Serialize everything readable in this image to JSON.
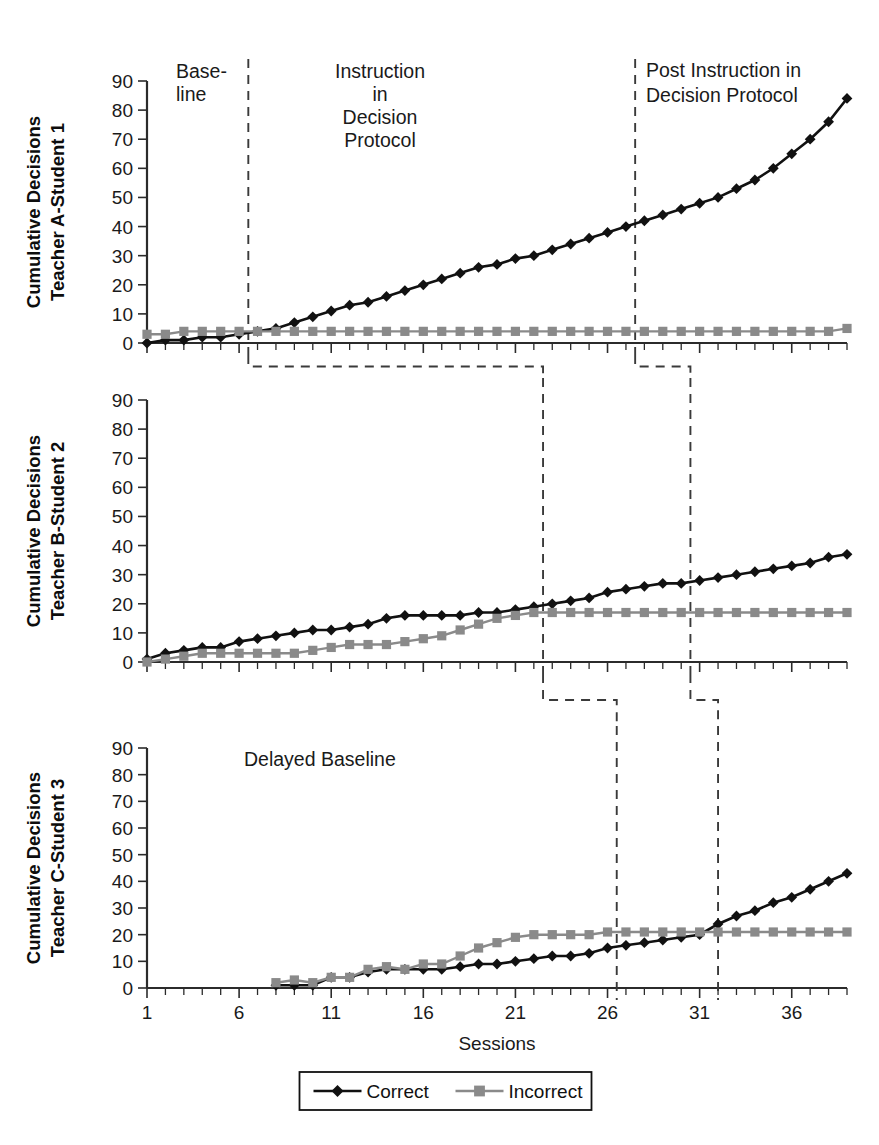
{
  "figure": {
    "x_axis_title": "Sessions",
    "y_tick_labels": [
      "0",
      "10",
      "20",
      "30",
      "40",
      "50",
      "60",
      "70",
      "80",
      "90"
    ],
    "x_tick_labels": [
      "1",
      "6",
      "11",
      "16",
      "21",
      "26",
      "31",
      "36"
    ],
    "legend": {
      "correct_label": "Correct",
      "incorrect_label": "Incorrect"
    },
    "colors": {
      "correct": "#111111",
      "incorrect": "#8a8a8a",
      "axis": "#2b2b2b",
      "phase_line": "#3a3a3a",
      "background": "#ffffff"
    },
    "panels": [
      {
        "id": "A",
        "y_axis_title_line1": "Cumulative Decisions",
        "y_axis_title_line2": "Teacher A-Student 1",
        "phase_labels": [
          {
            "name": "baseline",
            "text_line1": "Base-",
            "text_line2": "line"
          },
          {
            "name": "instruction",
            "text_line1": "Instruction",
            "text_line2": "in",
            "text_line3": "Decision",
            "text_line4": "Protocol"
          },
          {
            "name": "post-instruction",
            "text_line1": "Post Instruction in",
            "text_line2": "Decision Protocol"
          }
        ]
      },
      {
        "id": "B",
        "y_axis_title_line1": "Cumulative Decisions",
        "y_axis_title_line2": "Teacher B-Student 2",
        "phase_labels": []
      },
      {
        "id": "C",
        "y_axis_title_line1": "Cumulative Decisions",
        "y_axis_title_line2": "Teacher C-Student 3",
        "phase_labels": [
          {
            "name": "delayed-baseline",
            "text_line1": "Delayed Baseline"
          }
        ]
      }
    ]
  },
  "chart_data": {
    "type": "line",
    "title": "",
    "xlabel": "Sessions",
    "ylabel": "Cumulative Decisions",
    "xlim": [
      1,
      39
    ],
    "ylim": [
      0,
      90
    ],
    "xticks": [
      1,
      6,
      11,
      16,
      21,
      26,
      31,
      36
    ],
    "yticks": [
      0,
      10,
      20,
      30,
      40,
      50,
      60,
      70,
      80,
      90
    ],
    "grid": false,
    "legend": [
      "Correct",
      "Incorrect"
    ],
    "legend_position": "bottom-center",
    "panels": [
      {
        "name": "Teacher A-Student 1",
        "ylabel": "Cumulative Decisions Teacher A-Student 1",
        "phase_change_sessions": [
          6.5,
          27.5
        ],
        "phase_names": [
          "Baseline",
          "Instruction in Decision Protocol",
          "Post Instruction in Decision Protocol"
        ],
        "x": [
          1,
          2,
          3,
          4,
          5,
          6,
          7,
          8,
          9,
          10,
          11,
          12,
          13,
          14,
          15,
          16,
          17,
          18,
          19,
          20,
          21,
          22,
          23,
          24,
          25,
          26,
          27,
          28,
          29,
          30,
          31,
          32,
          33,
          34,
          35,
          36,
          37,
          38,
          39
        ],
        "series": [
          {
            "name": "Correct",
            "color": "#111111",
            "marker": "diamond",
            "values": [
              0,
              1,
              1,
              2,
              2,
              3,
              4,
              5,
              7,
              9,
              11,
              13,
              14,
              16,
              18,
              20,
              22,
              24,
              26,
              27,
              29,
              30,
              32,
              34,
              36,
              38,
              40,
              42,
              44,
              46,
              48,
              50,
              53,
              56,
              60,
              65,
              70,
              76,
              84
            ]
          },
          {
            "name": "Incorrect",
            "color": "#8a8a8a",
            "marker": "square",
            "values": [
              3,
              3,
              4,
              4,
              4,
              4,
              4,
              4,
              4,
              4,
              4,
              4,
              4,
              4,
              4,
              4,
              4,
              4,
              4,
              4,
              4,
              4,
              4,
              4,
              4,
              4,
              4,
              4,
              4,
              4,
              4,
              4,
              4,
              4,
              4,
              4,
              4,
              4,
              5
            ]
          }
        ]
      },
      {
        "name": "Teacher B-Student 2",
        "ylabel": "Cumulative Decisions Teacher B-Student 2",
        "phase_change_sessions": [
          22.5,
          30.5
        ],
        "phase_names": [
          "Baseline",
          "Instruction in Decision Protocol",
          "Post Instruction in Decision Protocol"
        ],
        "x": [
          1,
          2,
          3,
          4,
          5,
          6,
          7,
          8,
          9,
          10,
          11,
          12,
          13,
          14,
          15,
          16,
          17,
          18,
          19,
          20,
          21,
          22,
          23,
          24,
          25,
          26,
          27,
          28,
          29,
          30,
          31,
          32,
          33,
          34,
          35,
          36,
          37,
          38,
          39
        ],
        "series": [
          {
            "name": "Correct",
            "color": "#111111",
            "marker": "diamond",
            "values": [
              1,
              3,
              4,
              5,
              5,
              7,
              8,
              9,
              10,
              11,
              11,
              12,
              13,
              15,
              16,
              16,
              16,
              16,
              17,
              17,
              18,
              19,
              20,
              21,
              22,
              24,
              25,
              26,
              27,
              27,
              28,
              29,
              30,
              31,
              32,
              33,
              34,
              36,
              37
            ]
          },
          {
            "name": "Incorrect",
            "color": "#8a8a8a",
            "marker": "square",
            "values": [
              0,
              1,
              2,
              3,
              3,
              3,
              3,
              3,
              3,
              4,
              5,
              6,
              6,
              6,
              7,
              8,
              9,
              11,
              13,
              15,
              16,
              17,
              17,
              17,
              17,
              17,
              17,
              17,
              17,
              17,
              17,
              17,
              17,
              17,
              17,
              17,
              17,
              17,
              17
            ]
          }
        ]
      },
      {
        "name": "Teacher C-Student 3",
        "ylabel": "Cumulative Decisions Teacher C-Student 3",
        "phase_change_sessions": [
          26.5,
          32.0
        ],
        "phase_names": [
          "Delayed Baseline",
          "Instruction in Decision Protocol",
          "Post Instruction in Decision Protocol"
        ],
        "x": [
          8,
          9,
          10,
          11,
          12,
          13,
          14,
          15,
          16,
          17,
          18,
          19,
          20,
          21,
          22,
          23,
          24,
          25,
          26,
          27,
          28,
          29,
          30,
          31,
          32,
          33,
          34,
          35,
          36,
          37,
          38,
          39
        ],
        "series": [
          {
            "name": "Correct",
            "color": "#111111",
            "marker": "diamond",
            "values": [
              1,
              1,
              1,
              4,
              4,
              6,
              7,
              7,
              7,
              7,
              8,
              9,
              9,
              10,
              11,
              12,
              12,
              13,
              15,
              16,
              17,
              18,
              19,
              20,
              24,
              27,
              29,
              32,
              34,
              37,
              40,
              43
            ]
          },
          {
            "name": "Incorrect",
            "color": "#8a8a8a",
            "marker": "square",
            "values": [
              2,
              3,
              2,
              4,
              4,
              7,
              8,
              7,
              9,
              9,
              12,
              15,
              17,
              19,
              20,
              20,
              20,
              20,
              21,
              21,
              21,
              21,
              21,
              21,
              21,
              21,
              21,
              21,
              21,
              21,
              21,
              21
            ]
          }
        ]
      }
    ]
  }
}
